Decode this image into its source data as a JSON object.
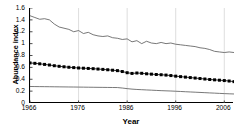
{
  "chart_data": {
    "type": "line",
    "title": "",
    "xlabel": "Year",
    "ylabel": "Abundance index",
    "xlim": [
      1966,
      2008
    ],
    "ylim": [
      0,
      1.6
    ],
    "grid": "vertical-light",
    "legend": "none",
    "x_ticks": [
      "1966",
      "1976",
      "1986",
      "1996",
      "2006"
    ],
    "x_tick_values": [
      1966,
      1976,
      1986,
      1996,
      2006
    ],
    "y_ticks": [
      "0",
      "0.2",
      "0.4",
      "0.6",
      "0.8",
      "1",
      "1.2",
      "1.4",
      "1.6"
    ],
    "y_tick_values": [
      0,
      0.2,
      0.4,
      0.6,
      0.8,
      1.0,
      1.2,
      1.4,
      1.6
    ],
    "x": [
      1966,
      1967,
      1968,
      1969,
      1970,
      1971,
      1972,
      1973,
      1974,
      1975,
      1976,
      1977,
      1978,
      1979,
      1980,
      1981,
      1982,
      1983,
      1984,
      1985,
      1986,
      1987,
      1988,
      1989,
      1990,
      1991,
      1992,
      1993,
      1994,
      1995,
      1996,
      1997,
      1998,
      1999,
      2000,
      2001,
      2002,
      2003,
      2004,
      2005,
      2006,
      2007,
      2008
    ],
    "series": [
      {
        "name": "upper-confidence-limit",
        "style": "thin-line",
        "color": "#555555",
        "values": [
          1.47,
          1.44,
          1.41,
          1.42,
          1.4,
          1.33,
          1.28,
          1.26,
          1.24,
          1.2,
          1.22,
          1.17,
          1.19,
          1.15,
          1.13,
          1.12,
          1.13,
          1.1,
          1.09,
          1.07,
          1.08,
          1.03,
          1.05,
          1.0,
          1.04,
          1.01,
          1.0,
          1.02,
          1.0,
          1.01,
          0.99,
          0.98,
          0.97,
          0.96,
          0.95,
          0.93,
          0.92,
          0.9,
          0.87,
          0.86,
          0.85,
          0.86,
          0.85
        ]
      },
      {
        "name": "abundance-index",
        "style": "square-markers",
        "color": "#000000",
        "values": [
          0.675,
          0.668,
          0.66,
          0.65,
          0.64,
          0.628,
          0.618,
          0.61,
          0.602,
          0.596,
          0.59,
          0.586,
          0.582,
          0.578,
          0.572,
          0.566,
          0.56,
          0.552,
          0.545,
          0.53,
          0.51,
          0.498,
          0.505,
          0.5,
          0.492,
          0.486,
          0.48,
          0.476,
          0.47,
          0.462,
          0.452,
          0.444,
          0.436,
          0.428,
          0.42,
          0.412,
          0.404,
          0.396,
          0.39,
          0.384,
          0.378,
          0.37,
          0.36
        ]
      },
      {
        "name": "lower-confidence-limit",
        "style": "thin-line",
        "color": "#555555",
        "values": [
          0.278,
          0.277,
          0.276,
          0.275,
          0.274,
          0.273,
          0.272,
          0.271,
          0.27,
          0.269,
          0.268,
          0.267,
          0.266,
          0.265,
          0.264,
          0.263,
          0.262,
          0.261,
          0.26,
          0.252,
          0.242,
          0.234,
          0.228,
          0.224,
          0.22,
          0.216,
          0.212,
          0.208,
          0.205,
          0.202,
          0.198,
          0.194,
          0.19,
          0.186,
          0.182,
          0.178,
          0.174,
          0.17,
          0.166,
          0.162,
          0.158,
          0.155,
          0.152
        ]
      }
    ]
  }
}
